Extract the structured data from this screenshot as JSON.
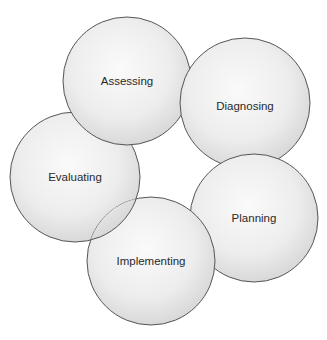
{
  "diagram": {
    "type": "cycle",
    "nodes": [
      {
        "id": "assessing",
        "label": "Assessing"
      },
      {
        "id": "diagnosing",
        "label": "Diagnosing"
      },
      {
        "id": "planning",
        "label": "Planning"
      },
      {
        "id": "implementing",
        "label": "Implementing"
      },
      {
        "id": "evaluating",
        "label": "Evaluating"
      }
    ]
  },
  "colors": {
    "circle_fill_center": "#f7f7f7",
    "circle_fill_edge": "#d9d9d9",
    "circle_stroke": "#555555",
    "text": "#2a2a2a"
  }
}
